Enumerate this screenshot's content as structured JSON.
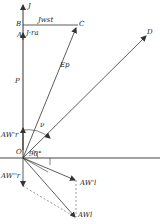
{
  "diagram": {
    "type": "vector-phasor-diagram",
    "colors": {
      "line": "#333333",
      "background": "#ffffff"
    },
    "labels": {
      "J": "J",
      "B": "B",
      "A": "A",
      "C": "C",
      "D": "D",
      "P": "P",
      "O": "O",
      "Ep": "Ep",
      "JwSt": "Jwst",
      "Jra": "J·ra",
      "nu": "ν",
      "angle90": "90°",
      "AWr1": "AW'r",
      "AWr2": "AW''r",
      "AWl1": "AW'l",
      "AWl": "AWl"
    },
    "points": {
      "O": [
        23,
        158
      ],
      "B": [
        23,
        25
      ],
      "A": [
        23,
        33
      ],
      "C": [
        78,
        25
      ],
      "D": [
        147,
        35
      ],
      "AWr1_tip": [
        23,
        130
      ],
      "AWr2_tip": [
        23,
        186
      ],
      "AWl1_tip": [
        76,
        180
      ],
      "AWl_tip": [
        76,
        218
      ]
    }
  }
}
